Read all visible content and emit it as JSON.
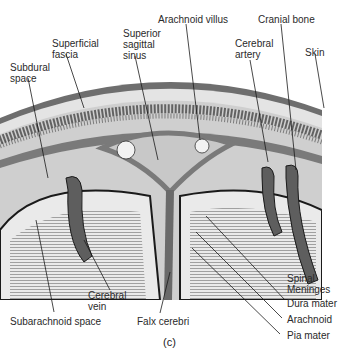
{
  "figure": {
    "panel_label": "(c)",
    "labels": {
      "superficial_fascia": "Superficial\nfascia",
      "superior_sagittal_sinus": "Superior\nsagittal\nsinus",
      "arachnoid_villus": "Arachnoid villus",
      "cranial_bone": "Cranial bone",
      "cerebral_artery": "Cerebral\nartery",
      "skin": "Skin",
      "subdural_space": "Subdural\nspace",
      "cerebral_vein": "Cerebral\nvein",
      "subarachnoid_space": "Subarachnoid space",
      "falx_cerebri": "Falx cerebri",
      "spinal_meninges": "Spinal\nMeninges",
      "dura_mater": "Dura mater",
      "arachnoid": "Arachnoid",
      "pia_mater": "Pia mater"
    },
    "colors": {
      "skin": "#6e6e6e",
      "fascia": "#e4e4e4",
      "bone": "#cfcfcf",
      "dura": "#7a7a7a",
      "sinus": "#c8c8c8",
      "vessel": "#5e5e5e",
      "brain": "#e8e8e8",
      "outline": "#1a1a1a"
    }
  }
}
